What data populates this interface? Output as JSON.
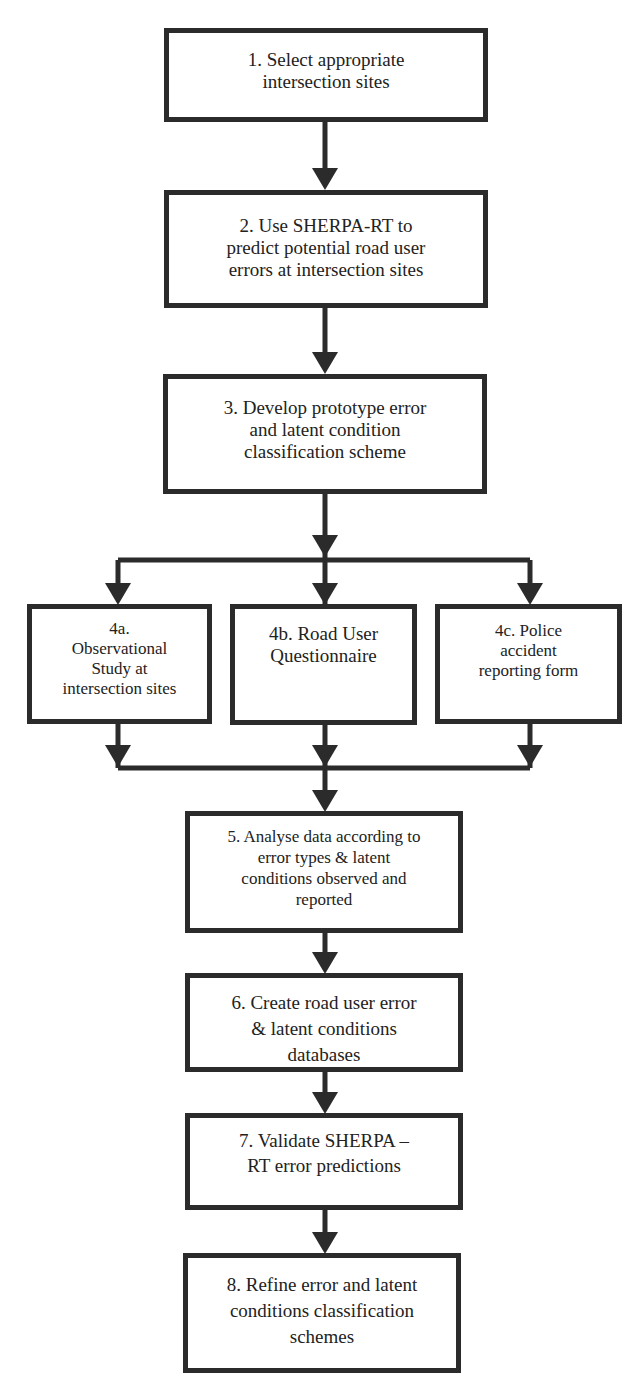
{
  "diagram": {
    "type": "flowchart",
    "line_color": "#2b2b2b",
    "steps": [
      {
        "id": "1",
        "label": "1. Select appropriate\nintersection sites"
      },
      {
        "id": "2",
        "label": "2. Use SHERPA-RT to\npredict potential road user\nerrors at intersection sites"
      },
      {
        "id": "3",
        "label": "3. Develop prototype error\nand latent condition\nclassification scheme"
      },
      {
        "id": "4a",
        "label": "4a.\nObservational\nStudy at\nintersection sites"
      },
      {
        "id": "4b",
        "label": "4b. Road User\nQuestionnaire"
      },
      {
        "id": "4c",
        "label": "4c. Police\naccident\nreporting form"
      },
      {
        "id": "5",
        "label": "5. Analyse data according to\nerror types & latent\nconditions observed and\nreported"
      },
      {
        "id": "6",
        "label": "6. Create road user error\n& latent conditions\ndatabases"
      },
      {
        "id": "7",
        "label": "7. Validate SHERPA –\nRT error predictions"
      },
      {
        "id": "8",
        "label": "8. Refine error and latent\nconditions classification\nschemes"
      }
    ],
    "edges": [
      [
        "1",
        "2"
      ],
      [
        "2",
        "3"
      ],
      [
        "3",
        "4a"
      ],
      [
        "3",
        "4b"
      ],
      [
        "3",
        "4c"
      ],
      [
        "4a",
        "5"
      ],
      [
        "4b",
        "5"
      ],
      [
        "4c",
        "5"
      ],
      [
        "5",
        "6"
      ],
      [
        "6",
        "7"
      ],
      [
        "7",
        "8"
      ]
    ]
  }
}
